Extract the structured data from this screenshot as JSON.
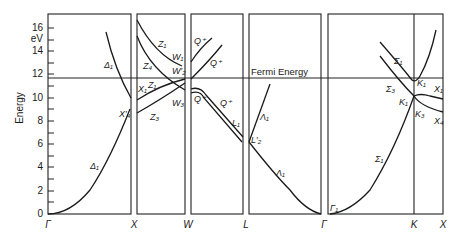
{
  "diagram": {
    "type": "band_structure",
    "y_axis": {
      "label": "Energy",
      "unit": "eV",
      "ticks": [
        "16",
        "14",
        "12",
        "10",
        "8",
        "6",
        "4",
        "2",
        "0"
      ]
    },
    "fermi_label": "Fermi Energy",
    "fermi_energy_ev": 11.7,
    "k_points": [
      "Γ",
      "X",
      "W",
      "L",
      "Γ",
      "K",
      "X"
    ],
    "band_labels": {
      "p1_delta_upper": "Δ₁",
      "p1_delta_lower": "Δ₁",
      "p1_x4": "X′₄",
      "p2_z1_top": "Z₁",
      "p2_w1": "W₁",
      "p2_z4": "Z₄",
      "p2_w2": "W′₂",
      "p2_x1": "X₁",
      "p2_z1_mid": "Z₁",
      "p2_w3": "W₃",
      "p2_z3": "Z₃",
      "p3_q_a": "Q⁺",
      "p3_q_b": "Q⁺",
      "p3_q_c": "Q⁺",
      "p3_q_d": "Q⁺",
      "p3_l1": "L₁",
      "p4_lambda_upper": "Λ₁",
      "p4_l2": "L′₂",
      "p4_lambda_lower": "Λ₁",
      "p5_gamma1": "Γ₁",
      "p5_sigma1_upper": "Σ₁",
      "p5_sigma3": "Σ₃",
      "p5_k1_upper": "K₁",
      "p5_k1_lower": "K₁",
      "p5_k3": "K₃",
      "p5_x1": "X₁",
      "p5_x4": "X₄",
      "p5_sigma1_lower": "Σ₁"
    }
  }
}
